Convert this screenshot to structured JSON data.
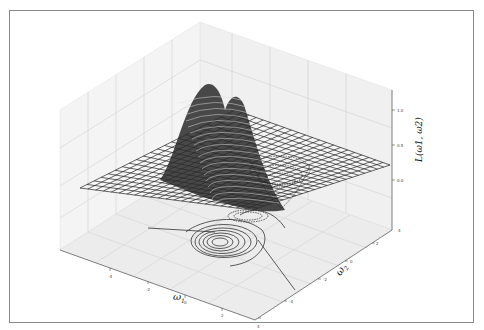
{
  "chart_data": {
    "type": "surface3d",
    "title": "",
    "xlabel": "ω1",
    "ylabel": "ω2",
    "zlabel": "L(ω1, ω2)",
    "x_ticks": [
      "-4",
      "-2",
      "0",
      "2",
      "4"
    ],
    "y_ticks": [
      "-4",
      "-2",
      "0",
      "2",
      "4"
    ],
    "z_ticks": [
      "1.0",
      "0.5",
      "0.0"
    ],
    "xlim": [
      -5,
      5
    ],
    "ylim": [
      -5,
      5
    ],
    "grid": true,
    "elements": [
      {
        "kind": "wireframe_surface",
        "description": "flat mesh with a tall double-peaked hump and an adjacent dashed well/depression",
        "peaks": 2
      },
      {
        "kind": "floor_contour",
        "description": "concentric contour rings projected on the floor plane beneath the surface"
      }
    ],
    "colors": {
      "line": "#1a1a1a",
      "pane": "#f2f2f2",
      "grid": "#d0d0d0",
      "frame": "#8a8a8a"
    }
  },
  "labels": {
    "x_axis": "ω",
    "x_sub": "1",
    "y_axis": "ω",
    "y_sub": "2",
    "z_axis": "L(ω1, ω2)"
  }
}
